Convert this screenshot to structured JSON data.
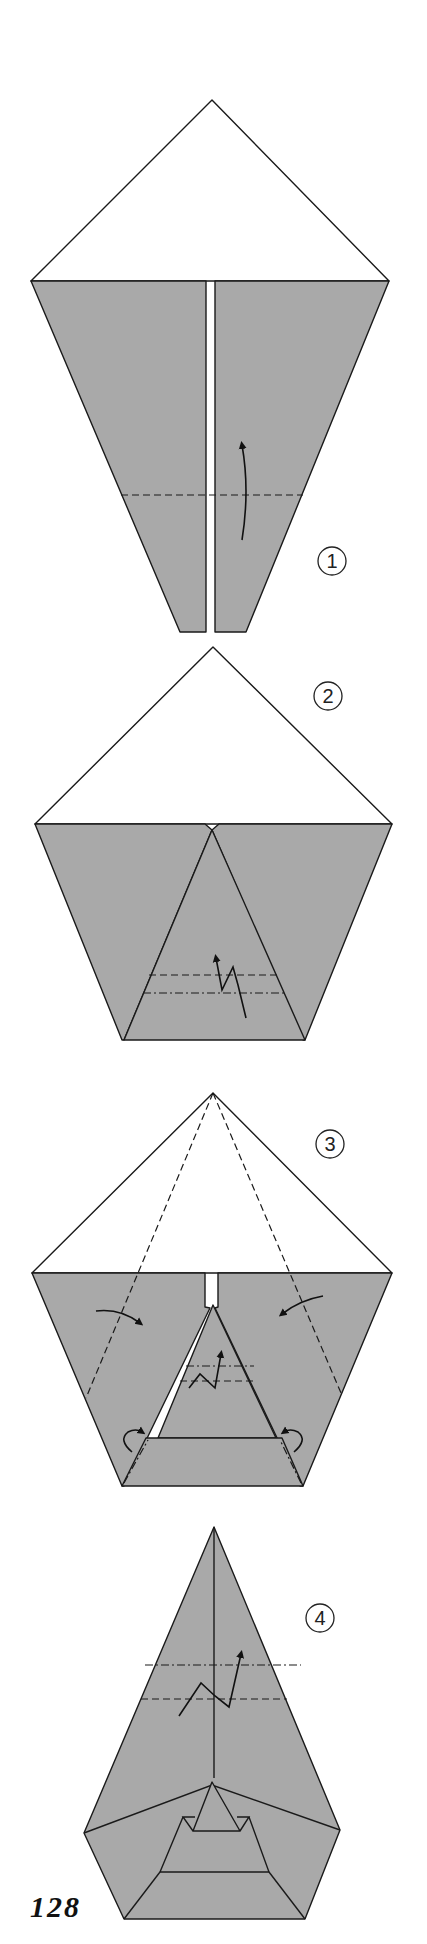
{
  "page": {
    "type": "origami-diagram",
    "page_number": "128",
    "colors": {
      "paper_colored_side": "#a9a9a9",
      "paper_white_side": "#ffffff",
      "line": "#1a1a1a"
    }
  },
  "steps": [
    {
      "number": "1",
      "instruction_symbols": [
        "valley-fold-line",
        "fold-up-arrow"
      ]
    },
    {
      "number": "2",
      "instruction_symbols": [
        "valley-fold-line",
        "mountain-fold-line",
        "pleat-arrow"
      ]
    },
    {
      "number": "3",
      "instruction_symbols": [
        "valley-fold-lines",
        "fold-in-arrows",
        "pleat-arrow",
        "tuck-arrows"
      ]
    },
    {
      "number": "4",
      "instruction_symbols": [
        "mountain-fold-line",
        "valley-fold-line",
        "pleat-arrow"
      ]
    }
  ]
}
